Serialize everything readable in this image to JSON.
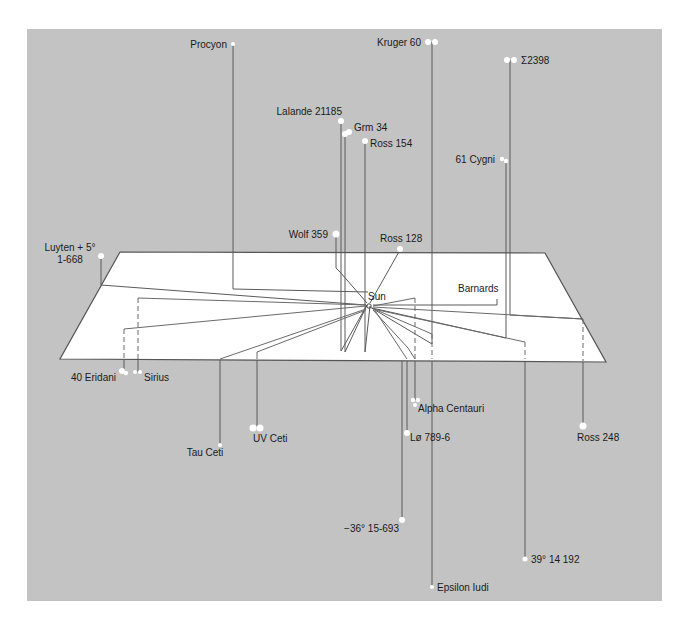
{
  "diagram": {
    "center": {
      "name": "Sun",
      "label": "Sun"
    },
    "colors": {
      "background": "#c3c3c3",
      "plane": "#ffffff",
      "lines": "#5a5a5a",
      "stars": "#ffffff",
      "text": "#1a1a1a"
    },
    "stars": [
      {
        "id": "procyon",
        "label": "Procyon",
        "position": "above-plane"
      },
      {
        "id": "kruger-60",
        "label": "Kruger 60",
        "position": "above-plane",
        "binary": true
      },
      {
        "id": "sigma-2398",
        "label": "Σ2398",
        "position": "above-plane",
        "binary": true
      },
      {
        "id": "lalande-21185",
        "label": "Lalande 21185",
        "position": "above-plane"
      },
      {
        "id": "grm-34",
        "label": "Grm 34",
        "position": "above-plane",
        "binary": true
      },
      {
        "id": "ross-154",
        "label": "Ross 154",
        "position": "above-plane"
      },
      {
        "id": "61-cygni",
        "label": "61 Cygni",
        "position": "above-plane",
        "binary": true
      },
      {
        "id": "wolf-359",
        "label": "Wolf 359",
        "position": "above-plane"
      },
      {
        "id": "ross-128",
        "label": "Ross 128",
        "position": "above-plane"
      },
      {
        "id": "luyten",
        "label_line1": "Luyten + 5°",
        "label_line2": "1-668",
        "position": "above-plane"
      },
      {
        "id": "barnards",
        "label": "Barnards",
        "position": "above-plane"
      },
      {
        "id": "40-eridani",
        "label": "40 Eridani",
        "position": "below-plane",
        "binary": true
      },
      {
        "id": "sirius",
        "label": "Sirius",
        "position": "below-plane",
        "binary": true
      },
      {
        "id": "tau-ceti",
        "label": "Tau Ceti",
        "position": "below-plane"
      },
      {
        "id": "uv-ceti",
        "label": "UV Ceti",
        "position": "below-plane",
        "binary": true
      },
      {
        "id": "alpha-centauri",
        "label": "Alpha Centauri",
        "position": "below-plane",
        "triple": true
      },
      {
        "id": "l-789-6",
        "label": "Lø 789-6",
        "position": "below-plane"
      },
      {
        "id": "ross-248",
        "label": "Ross 248",
        "position": "below-plane"
      },
      {
        "id": "minus-36",
        "label": "−36° 15-693",
        "position": "below-plane"
      },
      {
        "id": "39-14-192",
        "label": "39° 14 192",
        "position": "below-plane"
      },
      {
        "id": "epsilon-indi",
        "label": "Epsilon Iudi",
        "position": "below-plane"
      }
    ]
  }
}
